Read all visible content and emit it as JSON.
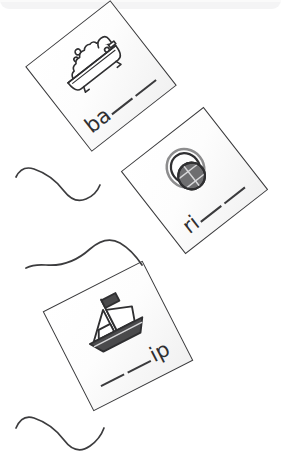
{
  "worksheet": {
    "background_color": "#ffffff",
    "ink_color": "#3a3a3c",
    "top_band_color": "#f4f4f5"
  },
  "cards": [
    {
      "id": "card-bathtub",
      "icon_name": "bathtub-icon",
      "picture_label": "bathtub",
      "prefix": "ba",
      "suffix": "",
      "blanks": 2,
      "rotation_deg": -38
    },
    {
      "id": "card-ring",
      "icon_name": "ring-icon",
      "picture_label": "ring",
      "prefix": "ri",
      "suffix": "",
      "blanks": 2,
      "rotation_deg": -38
    },
    {
      "id": "card-ship",
      "icon_name": "ship-icon",
      "picture_label": "ship",
      "prefix": "",
      "suffix": "ip",
      "blanks": 2,
      "rotation_deg": -27
    }
  ],
  "tails": [
    {
      "id": "tail-top",
      "attached_to": "card-bathtub"
    },
    {
      "id": "tail-middle",
      "attached_to": "card-ring"
    },
    {
      "id": "tail-bottom",
      "attached_to": "card-ship"
    }
  ]
}
